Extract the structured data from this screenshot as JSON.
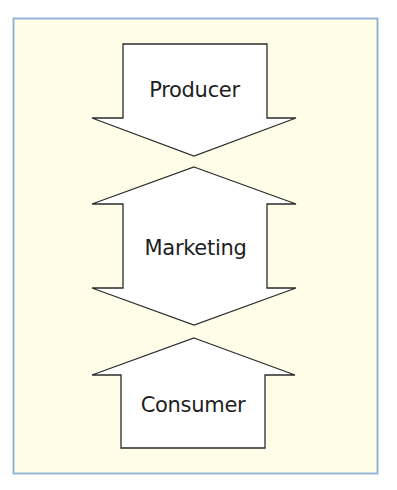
{
  "diagram": {
    "colors": {
      "page_background": "#ffffff",
      "panel_background": "#fffde8",
      "panel_border": "#8bb0d8",
      "shape_fill": "#ffffff",
      "shape_stroke": "#2b2b2b",
      "text": "#1e1e1e"
    },
    "nodes": [
      {
        "id": "producer",
        "label": "Producer",
        "shape": "down-arrow",
        "direction": "down"
      },
      {
        "id": "marketing",
        "label": "Marketing",
        "shape": "double-headed-vertical-arrow",
        "direction": "up-and-down"
      },
      {
        "id": "consumer",
        "label": "Consumer",
        "shape": "up-arrow",
        "direction": "up"
      }
    ],
    "relationships": [
      {
        "from": "producer",
        "to": "marketing",
        "direction": "down"
      },
      {
        "from": "consumer",
        "to": "marketing",
        "direction": "up"
      }
    ]
  }
}
